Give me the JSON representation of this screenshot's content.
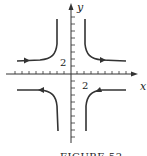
{
  "figure": {
    "caption": "FIGURE 52",
    "x_axis_label": "x",
    "y_axis_label": "y",
    "x_tick_label": "2",
    "y_tick_label": "2",
    "stroke_color": "#333333"
  },
  "curves": [
    {
      "name": "upper-left-branch",
      "arrow_direction": "right"
    },
    {
      "name": "upper-right-branch",
      "arrow_direction": "right"
    },
    {
      "name": "lower-left-branch",
      "arrow_direction": "left"
    },
    {
      "name": "lower-right-branch",
      "arrow_direction": "left"
    }
  ]
}
